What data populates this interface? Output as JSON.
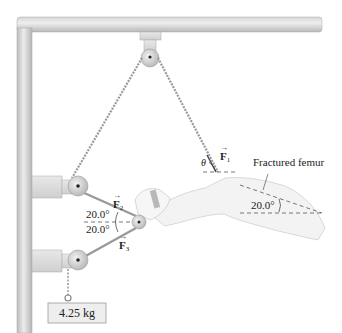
{
  "figure": {
    "type": "traction-apparatus",
    "labels": {
      "force_1": "F",
      "force_1_sub": "1",
      "force_2": "F",
      "force_2_sub": "2",
      "force_3": "F",
      "force_3_sub": "3",
      "theta": "θ",
      "femur_label": "Fractured femur",
      "angle_upper": "20.0°",
      "angle_lower": "20.0°",
      "angle_femur": "20.0°",
      "mass": "4.25 kg"
    },
    "colors": {
      "frame": "#c8c8c8",
      "frame_highlight": "#e6e6e6",
      "rope": "#9a9a9a",
      "leg": "#efefef",
      "leg_outline": "#cfcfcf",
      "text": "#222222"
    }
  }
}
